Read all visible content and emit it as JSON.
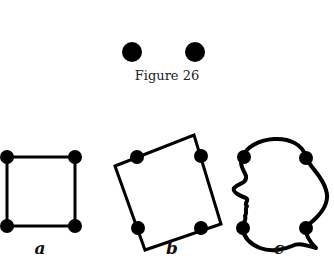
{
  "figure": {
    "caption": "Figure 26",
    "top_dots": [
      {
        "cx": 132,
        "cy": 52,
        "r": 10
      },
      {
        "cx": 195,
        "cy": 52,
        "r": 10
      }
    ],
    "panels": [
      {
        "label": "a",
        "label_x": 40,
        "label_y": 238,
        "shape": "square"
      },
      {
        "label": "b",
        "label_x": 172,
        "label_y": 238,
        "shape": "rotated-square"
      },
      {
        "label": "c",
        "label_x": 279,
        "label_y": 238,
        "shape": "face-profile"
      }
    ],
    "colors": {
      "ink": "#000000",
      "background": "#ffffff"
    }
  }
}
